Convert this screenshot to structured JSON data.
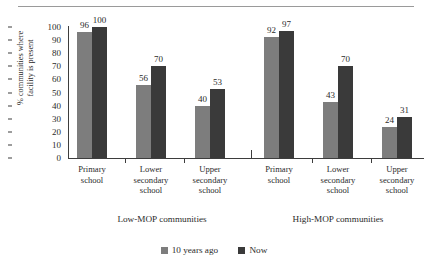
{
  "chart_data": {
    "type": "bar",
    "title": "",
    "xlabel": "",
    "ylabel_line1": "% communities where",
    "ylabel_line2": "facility is present",
    "ylim": [
      0,
      100
    ],
    "yticks": [
      100,
      90,
      80,
      70,
      60,
      50,
      40,
      30,
      20,
      10,
      0
    ],
    "grid": false,
    "legend_position": "bottom-center",
    "groups": [
      {
        "name": "Low-MOP communities",
        "categories": [
          {
            "label_line1": "Primary",
            "label_line2": "school",
            "label_line3": ""
          },
          {
            "label_line1": "Lower",
            "label_line2": "secondary",
            "label_line3": "school"
          },
          {
            "label_line1": "Upper",
            "label_line2": "secondary",
            "label_line3": "school"
          }
        ]
      },
      {
        "name": "High-MOP communities",
        "categories": [
          {
            "label_line1": "Primary",
            "label_line2": "school",
            "label_line3": ""
          },
          {
            "label_line1": "Lower",
            "label_line2": "secondary",
            "label_line3": "school"
          },
          {
            "label_line1": "Upper",
            "label_line2": "secondary",
            "label_line3": "school"
          }
        ]
      }
    ],
    "categories": [
      "Primary school (Low-MOP)",
      "Lower secondary school (Low-MOP)",
      "Upper secondary school (Low-MOP)",
      "Primary school (High-MOP)",
      "Lower secondary school (High-MOP)",
      "Upper secondary school (High-MOP)"
    ],
    "series": [
      {
        "name": "10 years ago",
        "color": "#7d7d7d",
        "values": [
          96,
          56,
          40,
          92,
          43,
          24
        ]
      },
      {
        "name": "Now",
        "color": "#3a3a3a",
        "values": [
          100,
          70,
          53,
          97,
          70,
          31
        ]
      }
    ]
  },
  "legend": {
    "items": [
      {
        "label": "10 years ago"
      },
      {
        "label": "Now"
      }
    ]
  }
}
